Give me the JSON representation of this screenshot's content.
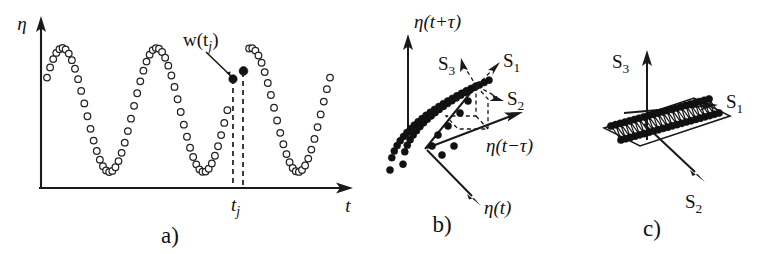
{
  "figure": {
    "background_color": "#ffffff",
    "ink_color": "#111111"
  },
  "panels": [
    {
      "id": "a",
      "caption": "a)",
      "description": "Sampled scalar time series eta(t) with the embedding window vector w(t_j) marked",
      "axes": {
        "y_label": "η",
        "x_label": "t",
        "x_tick_label": "t",
        "x_tick_sub": "j"
      },
      "annotation": {
        "vector_label_main": "w",
        "vector_label_paren_open": "(",
        "vector_label_var": "t",
        "vector_label_sub": "j",
        "vector_label_paren_close": ")",
        "marked_points": 2,
        "marker_style": "filled-circle"
      },
      "series": {
        "marker_style": "open-circle",
        "marker_count": 92,
        "waveform": "sinusoid",
        "cycles": 3,
        "amplitude": 62,
        "baseline_y": 110
      }
    },
    {
      "id": "b",
      "caption": "b)",
      "description": "Three-dimensional delay-embedding space with the reconstructed attractor and the rotated singular-vector frame",
      "axes": [
        {
          "name": "axis-eta-t-plus-tau",
          "label_pre": "η(t+τ",
          "label": "η(t+τ)"
        },
        {
          "name": "axis-eta-t-minus-tau",
          "label": "η(t−τ)"
        },
        {
          "name": "axis-eta-t",
          "label": "η(t)"
        }
      ],
      "singular_axes": [
        {
          "name": "S1",
          "letter": "S",
          "index": "1",
          "style": "dashed"
        },
        {
          "name": "S2",
          "letter": "S",
          "index": "2",
          "style": "dashed"
        },
        {
          "name": "S3",
          "letter": "S",
          "index": "3",
          "style": "dashed"
        }
      ],
      "attractor": {
        "marker_style": "filled-circle",
        "marker_count": 46,
        "shape": "folded-band"
      }
    },
    {
      "id": "c",
      "caption": "c)",
      "description": "Attractor projected onto the plane spanned by the two leading singular vectors S1 and S2",
      "singular_axes": [
        {
          "name": "S1",
          "letter": "S",
          "index": "1",
          "style": "solid",
          "direction": "right"
        },
        {
          "name": "S2",
          "letter": "S",
          "index": "2",
          "style": "solid",
          "direction": "lower-right"
        },
        {
          "name": "S3",
          "letter": "S",
          "index": "3",
          "style": "solid",
          "direction": "up"
        }
      ],
      "plane": {
        "name": "projection-plane",
        "marker_style": "filled-circle",
        "marker_count": 44,
        "pattern": "zigzag-band"
      }
    }
  ]
}
